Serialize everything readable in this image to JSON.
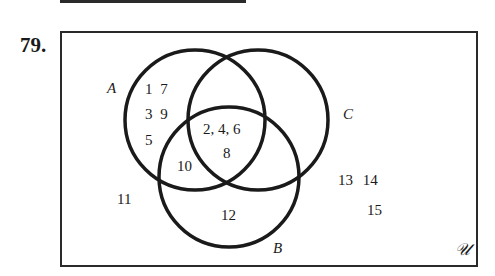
{
  "problem_number": "79.",
  "universe_label": "𝒰",
  "sets": [
    {
      "name": "A",
      "cx": 195,
      "cy": 120,
      "r": 70
    },
    {
      "name": "B",
      "cx": 229,
      "cy": 177,
      "r": 70
    },
    {
      "name": "C",
      "cx": 258,
      "cy": 120,
      "r": 70
    }
  ],
  "regions": {
    "A_only": "1  7\n3  9\n5",
    "A_only_row1": "1   7",
    "A_only_row2": "3   9",
    "A_only_row3": "5",
    "A_and_B_and_C": "2, 4, 6",
    "A_and_B_and_C_line2": "8",
    "A_and_B_only": "10",
    "B_only": "12",
    "outside_left": "11",
    "outside_right_row1": "13  14",
    "outside_right_row2": "15"
  },
  "labels": {
    "A": "A",
    "B": "B",
    "C": "C"
  },
  "colors": {
    "stroke": "#1a1a1a",
    "background": "#ffffff"
  }
}
